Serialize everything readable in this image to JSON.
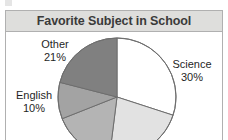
{
  "figure": {
    "title": "Favorite Subject in School"
  },
  "chart_data": {
    "type": "pie",
    "title": "Favorite Subject in School",
    "xlabel": "",
    "ylabel": "",
    "legend": "none",
    "grid": false,
    "unit": "%",
    "labels": [
      "Science",
      "Math",
      "Social Studies",
      "English",
      "Other"
    ],
    "values": [
      30,
      22,
      17,
      10,
      21
    ],
    "slices": [
      {
        "name": "Science",
        "label": "Science",
        "percent": "30%",
        "value": 30,
        "color": "#ffffff",
        "label_visible": true
      },
      {
        "name": "Math",
        "label": "",
        "percent": "",
        "value": 22,
        "color": "#e2e2e2",
        "label_visible": false
      },
      {
        "name": "Social Studies",
        "label": "",
        "percent": "",
        "value": 17,
        "color": "#b4b4b4",
        "label_visible": false
      },
      {
        "name": "English",
        "label": "English",
        "percent": "10%",
        "value": 10,
        "color": "#a3a3a3",
        "label_visible": true
      },
      {
        "name": "Other",
        "label": "Other",
        "percent": "21%",
        "value": 21,
        "color": "#808080",
        "label_visible": true
      }
    ],
    "start_angle_deg": 0,
    "direction": "clockwise"
  },
  "colors": {
    "title_bar_bg": "#dededc",
    "title_text": "#3a3a3a",
    "frame_border": "#b0b0b0",
    "plot_bg": "#ffffff",
    "label_text": "#1f1f1f",
    "slice_outline": "#6e6e6e"
  }
}
